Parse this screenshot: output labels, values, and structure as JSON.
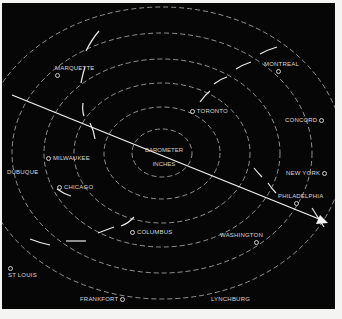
{
  "map": {
    "type": "barometric pressure map with isobars and storm track",
    "colors": {
      "background": "#060606",
      "isobar": "#bdbdbd",
      "track": "#f0f0f0",
      "text": "#d8d8d8",
      "margin": "#f4f4f2"
    },
    "center": {
      "line1": "BAROMETER",
      "line2": "INCHES"
    },
    "cities": [
      {
        "name": "MARQUETTE",
        "x": 53,
        "y": 66
      },
      {
        "name": "MONTREAL",
        "x": 262,
        "y": 62
      },
      {
        "name": "TORONTO",
        "x": 192,
        "y": 108
      },
      {
        "name": "CONCORD",
        "x": 283,
        "y": 117
      },
      {
        "name": "MILWAUKEE",
        "x": 46,
        "y": 155
      },
      {
        "name": "DUBUQUE",
        "x": 5,
        "y": 168
      },
      {
        "name": "CHICAGO",
        "x": 57,
        "y": 184
      },
      {
        "name": "NEW YORK",
        "x": 284,
        "y": 170
      },
      {
        "name": "PHILADELPHIA",
        "x": 278,
        "y": 193
      },
      {
        "name": "COLUMBUS",
        "x": 130,
        "y": 229
      },
      {
        "name": "WASHINGTON",
        "x": 221,
        "y": 233
      },
      {
        "name": "ST LOUIS",
        "x": 8,
        "y": 265
      },
      {
        "name": "FRANKFORT",
        "x": 80,
        "y": 296
      },
      {
        "name": "LYNCHBURG",
        "x": 211,
        "y": 296
      }
    ]
  }
}
